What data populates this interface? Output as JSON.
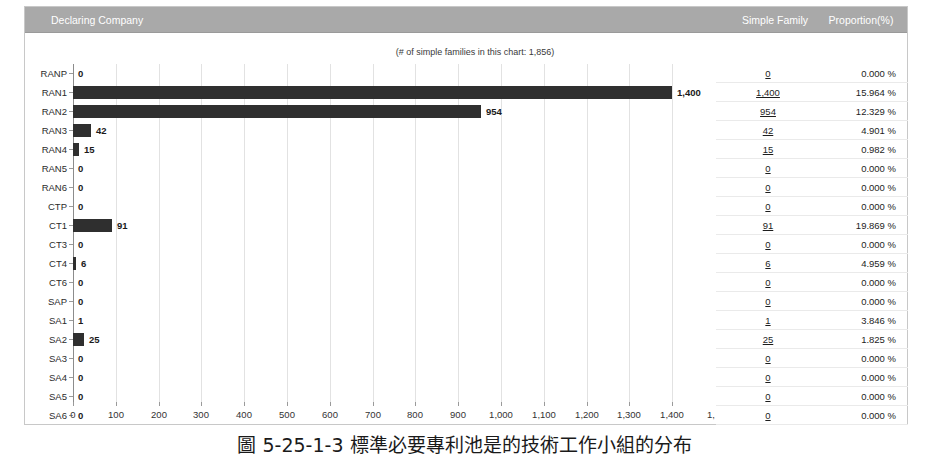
{
  "header": {
    "declaring_company": "Declaring Company",
    "simple_family": "Simple Family",
    "proportion": "Proportion(%)"
  },
  "chart_note": "(# of simple families in this chart: 1,856)",
  "caption": "圖 5-25-1-3 標準必要專利池是的技術工作小組的分布",
  "chart_data": {
    "type": "bar",
    "orientation": "horizontal",
    "title": "",
    "subtitle": "(# of simple families in this chart: 1,856)",
    "xlabel": "",
    "ylabel": "",
    "xlim": [
      0,
      1500
    ],
    "grid": true,
    "legend": "none",
    "xticks": [
      "0",
      "100",
      "200",
      "300",
      "400",
      "500",
      "600",
      "700",
      "800",
      "900",
      "1,000",
      "1,100",
      "1,200",
      "1,300",
      "1,400",
      "1,..."
    ],
    "xtick_values": [
      0,
      100,
      200,
      300,
      400,
      500,
      600,
      700,
      800,
      900,
      1000,
      1100,
      1200,
      1300,
      1400,
      1500
    ],
    "categories": [
      "RANP",
      "RAN1",
      "RAN2",
      "RAN3",
      "RAN4",
      "RAN5",
      "RAN6",
      "CTP",
      "CT1",
      "CT3",
      "CT4",
      "CT6",
      "SAP",
      "SA1",
      "SA2",
      "SA3",
      "SA4",
      "SA5",
      "SA6"
    ],
    "values": [
      0,
      1400,
      954,
      42,
      15,
      0,
      0,
      0,
      91,
      0,
      6,
      0,
      0,
      1,
      25,
      0,
      0,
      0,
      0
    ],
    "value_labels": [
      "0",
      "1,400",
      "954",
      "42",
      "15",
      "0",
      "0",
      "0",
      "91",
      "0",
      "6",
      "0",
      "0",
      "1",
      "25",
      "0",
      "0",
      "0",
      "0"
    ],
    "bar_color": "#2f2f2f"
  },
  "table": {
    "columns": [
      "Simple Family",
      "Proportion(%)"
    ],
    "rows": [
      {
        "category": "RANP",
        "simple_family": "0",
        "proportion": "0.000 %"
      },
      {
        "category": "RAN1",
        "simple_family": "1,400",
        "proportion": "15.964 %"
      },
      {
        "category": "RAN2",
        "simple_family": "954",
        "proportion": "12.329 %"
      },
      {
        "category": "RAN3",
        "simple_family": "42",
        "proportion": "4.901 %"
      },
      {
        "category": "RAN4",
        "simple_family": "15",
        "proportion": "0.982 %"
      },
      {
        "category": "RAN5",
        "simple_family": "0",
        "proportion": "0.000 %"
      },
      {
        "category": "RAN6",
        "simple_family": "0",
        "proportion": "0.000 %"
      },
      {
        "category": "CTP",
        "simple_family": "0",
        "proportion": "0.000 %"
      },
      {
        "category": "CT1",
        "simple_family": "91",
        "proportion": "19.869 %"
      },
      {
        "category": "CT3",
        "simple_family": "0",
        "proportion": "0.000 %"
      },
      {
        "category": "CT4",
        "simple_family": "6",
        "proportion": "4.959 %"
      },
      {
        "category": "CT6",
        "simple_family": "0",
        "proportion": "0.000 %"
      },
      {
        "category": "SAP",
        "simple_family": "0",
        "proportion": "0.000 %"
      },
      {
        "category": "SA1",
        "simple_family": "1",
        "proportion": "3.846 %"
      },
      {
        "category": "SA2",
        "simple_family": "25",
        "proportion": "1.825 %"
      },
      {
        "category": "SA3",
        "simple_family": "0",
        "proportion": "0.000 %"
      },
      {
        "category": "SA4",
        "simple_family": "0",
        "proportion": "0.000 %"
      },
      {
        "category": "SA5",
        "simple_family": "0",
        "proportion": "0.000 %"
      },
      {
        "category": "SA6",
        "simple_family": "0",
        "proportion": "0.000 %"
      }
    ]
  },
  "colors": {
    "header_bar": "#a9a9a9",
    "bar": "#2f2f2f",
    "grid": "#e2e2e2",
    "axis": "#8c8c8c"
  }
}
